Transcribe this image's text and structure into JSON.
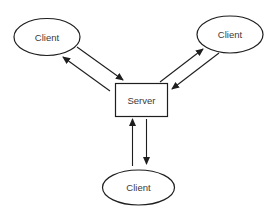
{
  "diagram": {
    "type": "client-server",
    "colors": {
      "stroke": "#1e1e1e",
      "text": "#3a3a3a",
      "background": "#ffffff"
    },
    "nodes": {
      "client_top_left": {
        "label": "Client",
        "shape": "ellipse"
      },
      "client_top_right": {
        "label": "Client",
        "shape": "ellipse"
      },
      "server": {
        "label": "Server",
        "shape": "rectangle"
      },
      "client_bottom": {
        "label": "Client",
        "shape": "ellipse"
      }
    },
    "edges": [
      {
        "from": "client_top_left",
        "to": "server"
      },
      {
        "from": "server",
        "to": "client_top_left"
      },
      {
        "from": "server",
        "to": "client_top_right"
      },
      {
        "from": "client_top_right",
        "to": "server"
      },
      {
        "from": "client_bottom",
        "to": "server"
      },
      {
        "from": "server",
        "to": "client_bottom"
      }
    ]
  }
}
